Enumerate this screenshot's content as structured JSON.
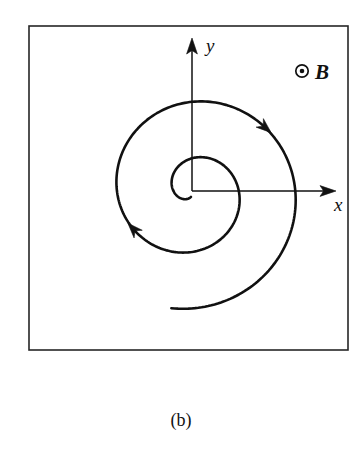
{
  "figure": {
    "caption": "(b)",
    "frame": {
      "x": 29,
      "y": 26,
      "width": 319,
      "height": 324,
      "stroke_color": "#262626"
    },
    "background_color": "#ffffff",
    "ink_color": "#111111"
  },
  "axes": {
    "origin": {
      "x": 192,
      "y": 191
    },
    "y_axis": {
      "label": "y",
      "label_x": 206,
      "label_y": 52,
      "tip_x": 192,
      "tip_y": 40,
      "base_y": 191
    },
    "x_axis": {
      "label": "x",
      "label_x": 334,
      "label_y": 211,
      "tip_x": 334,
      "tip_y": 191,
      "base_x": 192
    }
  },
  "bfield": {
    "label": "B",
    "symbol_name": "out-of-page-field",
    "circle_x": 302,
    "circle_y": 71,
    "circle_r": 6.2,
    "dot_r": 2.3,
    "label_x": 315,
    "label_y": 79
  },
  "chart_data": {
    "type": "line",
    "title": "(b)",
    "xlabel": "x",
    "ylabel": "y",
    "spiral": {
      "kind": "archimedean",
      "center": {
        "x": 192,
        "y": 191
      },
      "start_angle_deg": -100,
      "end_angle_deg": -820,
      "start_radius": 6,
      "end_radius": 119,
      "direction": "clockwise-outward",
      "turns": 2,
      "inner_loop_radius": 46,
      "outer_loop_radius": 119,
      "end_point": {
        "x": 311,
        "y": 191
      },
      "samples": 440
    },
    "direction_arrows": [
      {
        "name": "upper-right-arrow",
        "x": 281,
        "y": 110,
        "angle_deg": 52,
        "meaning": "clockwise motion"
      },
      {
        "name": "lower-left-arrow",
        "x": 119,
        "y": 241,
        "angle_deg": 233,
        "meaning": "clockwise motion"
      }
    ],
    "grid": false,
    "legend": false
  }
}
